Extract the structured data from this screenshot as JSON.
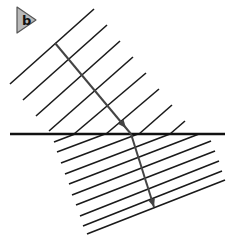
{
  "figure": {
    "panel_label": "b",
    "badge": {
      "points": "17,7 36,20 17,33",
      "fill": "#b9b9b9",
      "stroke": "#555555",
      "label_x": 22,
      "label_y": 25
    },
    "colors": {
      "line": "#1a1a1a",
      "ray": "#444444",
      "boundary": "#111111"
    },
    "boundary": {
      "x1": 10,
      "y1": 134,
      "x2": 225,
      "y2": 134,
      "width": 2.4
    },
    "upper_wavefronts": [
      {
        "x1": 10,
        "y1": 84,
        "x2": 94,
        "y2": 9
      },
      {
        "x1": 23,
        "y1": 100,
        "x2": 107,
        "y2": 25
      },
      {
        "x1": 36,
        "y1": 116,
        "x2": 120,
        "y2": 41
      },
      {
        "x1": 49,
        "y1": 131,
        "x2": 133,
        "y2": 57
      },
      {
        "x1": 74,
        "y1": 134,
        "x2": 146,
        "y2": 73
      },
      {
        "x1": 106,
        "y1": 134,
        "x2": 159,
        "y2": 89
      },
      {
        "x1": 139,
        "y1": 134,
        "x2": 172,
        "y2": 105
      },
      {
        "x1": 170,
        "y1": 134,
        "x2": 185,
        "y2": 121
      }
    ],
    "lower_wavefronts": [
      {
        "x1": 54,
        "y1": 142,
        "x2": 75,
        "y2": 134
      },
      {
        "x1": 57,
        "y1": 152,
        "x2": 105,
        "y2": 134
      },
      {
        "x1": 61,
        "y1": 163,
        "x2": 138,
        "y2": 134
      },
      {
        "x1": 65,
        "y1": 174,
        "x2": 170,
        "y2": 134
      },
      {
        "x1": 69,
        "y1": 184,
        "x2": 199,
        "y2": 134
      },
      {
        "x1": 72,
        "y1": 195,
        "x2": 211,
        "y2": 141
      },
      {
        "x1": 76,
        "y1": 205,
        "x2": 215,
        "y2": 151
      },
      {
        "x1": 80,
        "y1": 216,
        "x2": 219,
        "y2": 161
      },
      {
        "x1": 83,
        "y1": 226,
        "x2": 222,
        "y2": 171
      },
      {
        "x1": 87,
        "y1": 234,
        "x2": 225,
        "y2": 180
      }
    ],
    "ray": {
      "incident": {
        "x1": 55,
        "y1": 43,
        "x2": 131,
        "y2": 134
      },
      "incident_arrow": {
        "x": 126,
        "y": 128,
        "angle": 50
      },
      "refracted": {
        "x1": 131,
        "y1": 134,
        "x2": 154,
        "y2": 207
      },
      "refracted_arrow": {
        "x": 154,
        "y": 207,
        "angle": 72
      },
      "width": 2
    }
  }
}
